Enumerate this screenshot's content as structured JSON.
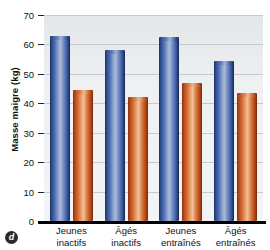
{
  "panel": {
    "badge_label": "d"
  },
  "chart_data": {
    "type": "bar",
    "title": "",
    "xlabel": "",
    "ylabel": "Masse maigre (kg)",
    "ylim": [
      0,
      70
    ],
    "yticks": [
      0,
      10,
      20,
      30,
      40,
      50,
      60,
      70
    ],
    "ytick_labels": [
      "0",
      "10",
      "20",
      "30",
      "40",
      "50",
      "60",
      "70"
    ],
    "grid": true,
    "legend": "none",
    "categories": [
      "Jeunes inactifs",
      "Âgés inactifs",
      "Jeunes entraînés",
      "Âgés entraînés"
    ],
    "category_lines": [
      {
        "line1": "Jeunes",
        "line2": "inactifs"
      },
      {
        "line1": "Âgés",
        "line2": "inactifs"
      },
      {
        "line1": "Jeunes",
        "line2": "entraînés"
      },
      {
        "line1": "Âgés",
        "line2": "entraînés"
      }
    ],
    "series": [
      {
        "name": "blue-series",
        "color": "#4f6fb3",
        "values": [
          63.0,
          58.0,
          62.5,
          54.5
        ]
      },
      {
        "name": "orange-series",
        "color": "#d26a31",
        "values": [
          44.5,
          42.0,
          47.0,
          43.5
        ]
      }
    ]
  }
}
